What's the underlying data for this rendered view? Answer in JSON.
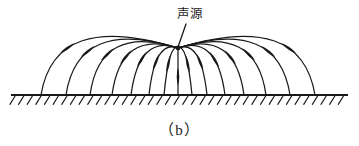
{
  "figure": {
    "caption": "（b）",
    "source_label": "声源",
    "background_color": "#ffffff",
    "ink_color": "#1a1a1a"
  },
  "chart_data": {
    "type": "diagram",
    "title": "声源",
    "subtitle": "（b）",
    "xlabel": "",
    "ylabel": "",
    "xlim": [
      0,
      359
    ],
    "ylim": [
      146,
      0
    ],
    "grid": false,
    "legend": null,
    "annotations": [
      {
        "text": "声源",
        "x": 190,
        "y": 14
      },
      {
        "text": "（b）",
        "x": 180,
        "y": 128
      }
    ],
    "source_point": {
      "x": 178,
      "y": 48
    },
    "ground": {
      "y": 95,
      "x_start": 11,
      "x_end": 348,
      "hatch_count": 39,
      "hatch_length": 11,
      "hatch_angle_deg": -58
    },
    "ray_count": 15,
    "rays": [
      {
        "index": 1,
        "side": "left",
        "ground_x": 41,
        "control_x": 55,
        "control_y": 10,
        "arrow_t": 0.62
      },
      {
        "index": 2,
        "side": "left",
        "ground_x": 66,
        "control_x": 78,
        "control_y": 17,
        "arrow_t": 0.62
      },
      {
        "index": 3,
        "side": "left",
        "ground_x": 90,
        "control_x": 100,
        "control_y": 23,
        "arrow_t": 0.62
      },
      {
        "index": 4,
        "side": "left",
        "ground_x": 112,
        "control_x": 121,
        "control_y": 29,
        "arrow_t": 0.62
      },
      {
        "index": 5,
        "side": "left",
        "ground_x": 131,
        "control_x": 139,
        "control_y": 34,
        "arrow_t": 0.62
      },
      {
        "index": 6,
        "side": "left",
        "ground_x": 149,
        "control_x": 155,
        "control_y": 39,
        "arrow_t": 0.62
      },
      {
        "index": 7,
        "side": "left",
        "ground_x": 164,
        "control_x": 169,
        "control_y": 43,
        "arrow_t": 0.62
      },
      {
        "index": 8,
        "side": "center",
        "ground_x": 178,
        "control_x": 178,
        "control_y": 48,
        "arrow_t": 0.6
      },
      {
        "index": 9,
        "side": "right",
        "ground_x": 192,
        "control_x": 187,
        "control_y": 43,
        "arrow_t": 0.62
      },
      {
        "index": 10,
        "side": "right",
        "ground_x": 207,
        "control_x": 201,
        "control_y": 39,
        "arrow_t": 0.62
      },
      {
        "index": 11,
        "side": "right",
        "ground_x": 225,
        "control_x": 217,
        "control_y": 34,
        "arrow_t": 0.62
      },
      {
        "index": 12,
        "side": "right",
        "ground_x": 244,
        "control_x": 235,
        "control_y": 29,
        "arrow_t": 0.62
      },
      {
        "index": 13,
        "side": "right",
        "ground_x": 266,
        "control_x": 256,
        "control_y": 23,
        "arrow_t": 0.62
      },
      {
        "index": 14,
        "side": "right",
        "ground_x": 290,
        "control_x": 278,
        "control_y": 17,
        "arrow_t": 0.62
      },
      {
        "index": 15,
        "side": "right",
        "ground_x": 315,
        "control_x": 301,
        "control_y": 10,
        "arrow_t": 0.62
      }
    ],
    "leader_line": {
      "x1": 186,
      "y1": 24,
      "x2": 178,
      "y2": 47
    }
  }
}
